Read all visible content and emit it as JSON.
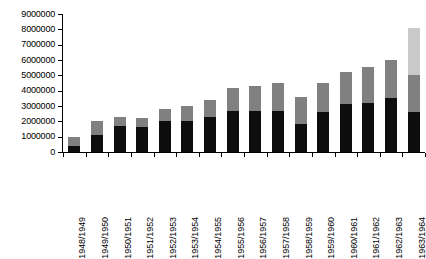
{
  "chart_data": {
    "type": "bar",
    "stacked": true,
    "title": "",
    "subtitle": "",
    "xlabel": "",
    "ylabel": "",
    "ylim": [
      0,
      9000000
    ],
    "ytick_values": [
      0,
      1000000,
      2000000,
      3000000,
      4000000,
      5000000,
      6000000,
      7000000,
      8000000,
      9000000
    ],
    "ytick_labels": [
      "0",
      "1000000",
      "2000000",
      "3000000",
      "4000000",
      "5000000",
      "6000000",
      "7000000",
      "8000000",
      "9000000"
    ],
    "grid": false,
    "legend": "none",
    "categories": [
      "1948/1949",
      "1949/1950",
      "1950/1951",
      "1951/1952",
      "1952/1953",
      "1953/1954",
      "1954/1955",
      "1955/1956",
      "1956/1957",
      "1957/1958",
      "1958/1959",
      "1959/1960",
      "1960/1961",
      "1961/1962",
      "1962/1963",
      "1963/1964"
    ],
    "series": [
      {
        "name": "series-1",
        "color": "#0d0d0d",
        "values": [
          400000,
          1100000,
          1700000,
          1650000,
          2000000,
          2000000,
          2300000,
          2650000,
          2700000,
          2700000,
          1800000,
          2600000,
          3100000,
          3200000,
          3500000,
          2600000
        ]
      },
      {
        "name": "series-2",
        "color": "#808080",
        "values": [
          600000,
          900000,
          600000,
          600000,
          800000,
          1000000,
          1100000,
          1550000,
          1600000,
          1800000,
          1800000,
          1900000,
          2100000,
          2350000,
          2500000,
          2400000
        ]
      },
      {
        "name": "series-3",
        "color": "#c9c9c9",
        "values": [
          0,
          0,
          0,
          0,
          0,
          0,
          0,
          0,
          0,
          0,
          0,
          0,
          0,
          0,
          0,
          3100000
        ]
      }
    ],
    "totals": [
      1000000,
      2000000,
      2300000,
      2250000,
      2800000,
      3000000,
      3400000,
      4200000,
      4300000,
      4500000,
      3600000,
      4500000,
      5200000,
      5550000,
      6000000,
      8100000
    ]
  },
  "axis": {
    "y_max_label": "9000000",
    "y_min_label": "0"
  },
  "colors": {
    "background": "#ffffff",
    "axis": "#000000",
    "series_1": "#0d0d0d",
    "series_2": "#808080",
    "series_3": "#c9c9c9"
  }
}
